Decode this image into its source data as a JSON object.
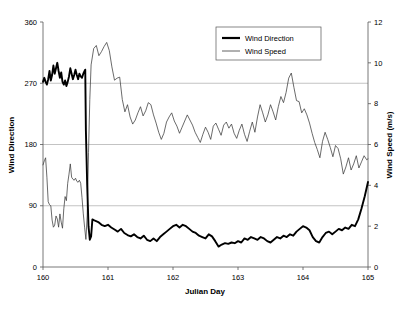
{
  "chart_data": {
    "type": "line",
    "title": "",
    "xlabel": "Julian Day",
    "ylabel": "Wind Direction",
    "y2label": "Wind Speed (m/s)",
    "xlim": [
      160,
      165
    ],
    "ylim": [
      0,
      360
    ],
    "y2lim": [
      0,
      12
    ],
    "xticks": [
      160,
      161,
      162,
      163,
      164,
      165
    ],
    "xtick_labels": [
      "160",
      "161",
      "162",
      "163",
      "164",
      "165"
    ],
    "yticks": [
      0,
      90,
      180,
      270,
      360
    ],
    "ytick_labels": [
      "0",
      "90",
      "180",
      "270",
      "360"
    ],
    "y2ticks": [
      0,
      2,
      4,
      6,
      8,
      10,
      12
    ],
    "y2tick_labels": [
      "0",
      "2",
      "4",
      "6",
      "8",
      "10",
      "12"
    ],
    "grid": "horizontal-major",
    "gridlines_at": [
      90,
      180,
      270
    ],
    "legend_position": "top-center",
    "legend": [
      "Wind Direction",
      "Wind Speed"
    ],
    "series": [
      {
        "name": "Wind Direction",
        "axis": "left",
        "units": "degrees",
        "color": "#000000",
        "line_width": "thick",
        "x": [
          160.0,
          160.02,
          160.04,
          160.06,
          160.08,
          160.1,
          160.12,
          160.14,
          160.16,
          160.18,
          160.2,
          160.22,
          160.24,
          160.26,
          160.28,
          160.3,
          160.32,
          160.34,
          160.36,
          160.38,
          160.4,
          160.42,
          160.44,
          160.46,
          160.48,
          160.5,
          160.52,
          160.54,
          160.56,
          160.58,
          160.6,
          160.62,
          160.64,
          160.65,
          160.66,
          160.68,
          160.7,
          160.72,
          160.74,
          160.76,
          160.8,
          160.85,
          160.9,
          160.95,
          161.0,
          161.05,
          161.1,
          161.15,
          161.2,
          161.25,
          161.3,
          161.35,
          161.4,
          161.45,
          161.5,
          161.55,
          161.6,
          161.65,
          161.7,
          161.75,
          161.8,
          161.85,
          161.9,
          161.95,
          162.0,
          162.05,
          162.1,
          162.15,
          162.2,
          162.25,
          162.3,
          162.35,
          162.4,
          162.45,
          162.5,
          162.55,
          162.6,
          162.65,
          162.7,
          162.75,
          162.8,
          162.85,
          162.9,
          162.95,
          163.0,
          163.05,
          163.1,
          163.15,
          163.2,
          163.25,
          163.3,
          163.35,
          163.4,
          163.45,
          163.5,
          163.55,
          163.6,
          163.65,
          163.7,
          163.75,
          163.8,
          163.85,
          163.9,
          163.95,
          164.0,
          164.05,
          164.1,
          164.15,
          164.2,
          164.25,
          164.3,
          164.35,
          164.4,
          164.45,
          164.5,
          164.55,
          164.6,
          164.65,
          164.7,
          164.75,
          164.8,
          164.85,
          164.9,
          164.95,
          165.0
        ],
        "y": [
          272,
          278,
          272,
          268,
          276,
          288,
          274,
          282,
          296,
          284,
          292,
          300,
          288,
          278,
          286,
          272,
          268,
          274,
          266,
          272,
          280,
          292,
          284,
          276,
          282,
          290,
          282,
          276,
          284,
          280,
          278,
          284,
          288,
          290,
          200,
          120,
          60,
          40,
          45,
          70,
          68,
          66,
          62,
          60,
          62,
          58,
          55,
          52,
          56,
          50,
          47,
          45,
          48,
          44,
          42,
          46,
          40,
          38,
          42,
          38,
          44,
          48,
          52,
          56,
          60,
          62,
          58,
          62,
          60,
          56,
          52,
          50,
          46,
          44,
          42,
          48,
          45,
          38,
          30,
          33,
          35,
          34,
          36,
          35,
          38,
          36,
          42,
          40,
          44,
          42,
          40,
          44,
          42,
          38,
          36,
          40,
          44,
          42,
          46,
          44,
          48,
          46,
          52,
          56,
          60,
          58,
          54,
          44,
          38,
          36,
          44,
          50,
          52,
          48,
          52,
          56,
          54,
          58,
          56,
          62,
          60,
          70,
          86,
          104,
          125
        ]
      },
      {
        "name": "Wind Speed",
        "axis": "right",
        "units": "m/s",
        "color": "#3a3a3a",
        "line_width": "thin",
        "x": [
          160.0,
          160.02,
          160.04,
          160.06,
          160.08,
          160.1,
          160.12,
          160.14,
          160.16,
          160.18,
          160.2,
          160.22,
          160.24,
          160.26,
          160.28,
          160.3,
          160.32,
          160.34,
          160.36,
          160.38,
          160.4,
          160.42,
          160.44,
          160.46,
          160.48,
          160.5,
          160.52,
          160.54,
          160.56,
          160.58,
          160.6,
          160.62,
          160.64,
          160.66,
          160.68,
          160.7,
          160.72,
          160.74,
          160.78,
          160.82,
          160.86,
          160.9,
          160.94,
          160.98,
          161.02,
          161.06,
          161.1,
          161.14,
          161.18,
          161.22,
          161.26,
          161.3,
          161.34,
          161.38,
          161.42,
          161.46,
          161.5,
          161.54,
          161.58,
          161.62,
          161.66,
          161.7,
          161.74,
          161.78,
          161.82,
          161.86,
          161.9,
          161.94,
          161.98,
          162.02,
          162.06,
          162.1,
          162.14,
          162.18,
          162.22,
          162.26,
          162.3,
          162.34,
          162.38,
          162.42,
          162.46,
          162.5,
          162.54,
          162.58,
          162.62,
          162.66,
          162.7,
          162.74,
          162.78,
          162.82,
          162.86,
          162.9,
          162.94,
          162.98,
          163.02,
          163.06,
          163.1,
          163.14,
          163.18,
          163.22,
          163.26,
          163.3,
          163.34,
          163.38,
          163.42,
          163.46,
          163.5,
          163.54,
          163.58,
          163.62,
          163.66,
          163.7,
          163.74,
          163.78,
          163.82,
          163.86,
          163.9,
          163.94,
          163.98,
          164.02,
          164.06,
          164.1,
          164.14,
          164.18,
          164.22,
          164.26,
          164.3,
          164.34,
          164.38,
          164.42,
          164.46,
          164.5,
          164.54,
          164.58,
          164.62,
          164.66,
          164.7,
          164.74,
          164.78,
          164.82,
          164.86,
          164.9,
          164.94,
          164.98,
          165.0
        ],
        "y": [
          5.0,
          5.2,
          5.35,
          4.4,
          3.2,
          3.05,
          3.0,
          2.3,
          1.95,
          2.05,
          2.5,
          2.35,
          1.95,
          2.6,
          2.2,
          1.9,
          2.85,
          3.45,
          3.25,
          4.1,
          4.55,
          5.05,
          4.4,
          4.3,
          4.25,
          4.35,
          4.2,
          4.15,
          4.25,
          4.1,
          3.4,
          2.6,
          1.95,
          1.35,
          2.5,
          5.6,
          8.2,
          9.9,
          10.7,
          10.85,
          10.35,
          10.55,
          10.8,
          11.0,
          10.6,
          9.8,
          9.15,
          9.25,
          9.3,
          8.2,
          7.6,
          7.95,
          7.35,
          7.0,
          7.2,
          7.55,
          7.85,
          7.4,
          7.65,
          8.05,
          7.95,
          7.45,
          7.05,
          6.6,
          6.25,
          6.55,
          7.1,
          7.35,
          7.55,
          7.15,
          6.9,
          6.55,
          6.85,
          7.15,
          7.45,
          7.2,
          6.95,
          6.6,
          6.35,
          6.1,
          6.5,
          6.85,
          6.6,
          6.25,
          6.9,
          7.05,
          6.75,
          6.45,
          6.95,
          7.1,
          6.8,
          7.0,
          6.55,
          6.3,
          6.7,
          7.0,
          6.5,
          6.15,
          6.65,
          7.1,
          6.6,
          7.35,
          7.95,
          7.55,
          7.1,
          7.45,
          7.95,
          7.6,
          7.2,
          7.85,
          8.35,
          8.05,
          8.55,
          9.25,
          9.5,
          8.8,
          8.15,
          8.1,
          7.55,
          7.75,
          7.45,
          7.05,
          6.55,
          6.1,
          5.75,
          5.35,
          6.15,
          6.6,
          6.25,
          5.85,
          5.4,
          5.95,
          5.8,
          5.3,
          4.55,
          4.9,
          5.35,
          4.75,
          5.05,
          5.45,
          4.85,
          5.15,
          5.45,
          5.25,
          5.3
        ]
      }
    ]
  },
  "axes": {
    "left_title": "Wind Direction",
    "right_title": "Wind Speed (m/s)",
    "bottom_title": "Julian Day"
  },
  "legend": {
    "items": [
      {
        "label": "Wind Direction",
        "style": "thick-line"
      },
      {
        "label": "Wind Speed",
        "style": "thin-line"
      }
    ]
  },
  "colors": {
    "direction": "#000000",
    "speed": "#3a3a3a",
    "grid": "#9a9a9a",
    "frame": "#555555",
    "background": "#ffffff"
  }
}
